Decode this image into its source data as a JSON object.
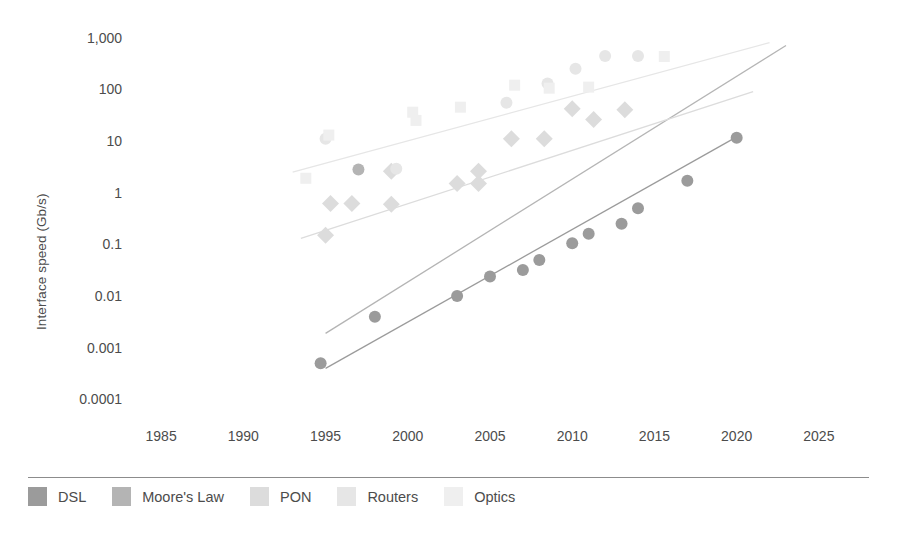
{
  "chart_data": {
    "type": "scatter",
    "title": "",
    "subtitle": "",
    "xlabel": "",
    "ylabel": "Interface speed (Gb/s)",
    "yscale": "log",
    "xlim": [
      1982.5,
      2027.5
    ],
    "ylim": [
      0.0001,
      3000
    ],
    "grid": false,
    "legend_position": "bottom",
    "x_ticks": [
      "1985",
      "1990",
      "1995",
      "2000",
      "2005",
      "2010",
      "2015",
      "2020",
      "2025"
    ],
    "y_ticks": [
      "1,000",
      "100",
      "10",
      "1",
      "0.1",
      "0.01",
      "0.001",
      "0.0001"
    ],
    "series": [
      {
        "name": "DSL",
        "color": "#9b9b9b",
        "marker": "circle",
        "trendline": true,
        "trend_x": [
          1995,
          2020
        ],
        "trend_y": [
          0.0004,
          12
        ],
        "points": [
          {
            "x": 1994.7,
            "y": 0.0005
          },
          {
            "x": 1998.0,
            "y": 0.004
          },
          {
            "x": 2003.0,
            "y": 0.01
          },
          {
            "x": 2005.0,
            "y": 0.024
          },
          {
            "x": 2007.0,
            "y": 0.032
          },
          {
            "x": 2008.0,
            "y": 0.05
          },
          {
            "x": 2010.0,
            "y": 0.105
          },
          {
            "x": 2011.0,
            "y": 0.16
          },
          {
            "x": 2013.0,
            "y": 0.25
          },
          {
            "x": 2014.0,
            "y": 0.5
          },
          {
            "x": 2017.0,
            "y": 1.7
          },
          {
            "x": 2020.0,
            "y": 11.5
          }
        ]
      },
      {
        "name": "Moore's Law",
        "color": "#b4b4b4",
        "marker": "circle",
        "trendline": true,
        "trend_x": [
          1995,
          2023
        ],
        "trend_y": [
          0.0019,
          700
        ],
        "points": [
          {
            "x": 1997.0,
            "y": 2.8
          }
        ]
      },
      {
        "name": "PON",
        "color": "#dcdcdc",
        "marker": "diamond",
        "trendline": true,
        "trend_x": [
          1993.5,
          2021
        ],
        "trend_y": [
          0.13,
          90
        ],
        "points": [
          {
            "x": 1995.0,
            "y": 0.15
          },
          {
            "x": 1995.3,
            "y": 0.62
          },
          {
            "x": 1996.6,
            "y": 0.62
          },
          {
            "x": 1999.0,
            "y": 0.6
          },
          {
            "x": 1999.0,
            "y": 2.6
          },
          {
            "x": 2003.0,
            "y": 1.5
          },
          {
            "x": 2004.3,
            "y": 1.5
          },
          {
            "x": 2004.3,
            "y": 2.6
          },
          {
            "x": 2006.3,
            "y": 11
          },
          {
            "x": 2008.3,
            "y": 11
          },
          {
            "x": 2010.0,
            "y": 42
          },
          {
            "x": 2011.3,
            "y": 26
          },
          {
            "x": 2013.2,
            "y": 40
          }
        ]
      },
      {
        "name": "Routers",
        "color": "#e6e6e6",
        "marker": "circle",
        "trendline": true,
        "trend_x": [
          1993,
          2022
        ],
        "trend_y": [
          2.5,
          800
        ],
        "points": [
          {
            "x": 1995.0,
            "y": 11
          },
          {
            "x": 1999.3,
            "y": 2.9
          },
          {
            "x": 2006.0,
            "y": 55
          },
          {
            "x": 2008.5,
            "y": 130
          },
          {
            "x": 2010.2,
            "y": 250
          },
          {
            "x": 2012.0,
            "y": 440
          },
          {
            "x": 2014.0,
            "y": 440
          }
        ]
      },
      {
        "name": "Optics",
        "color": "#efefef",
        "marker": "square",
        "trendline": false,
        "points": [
          {
            "x": 1993.8,
            "y": 1.9
          },
          {
            "x": 1995.2,
            "y": 13
          },
          {
            "x": 2000.3,
            "y": 36
          },
          {
            "x": 2000.5,
            "y": 25
          },
          {
            "x": 2003.2,
            "y": 45
          },
          {
            "x": 2006.5,
            "y": 120
          },
          {
            "x": 2008.6,
            "y": 105
          },
          {
            "x": 2011.0,
            "y": 110
          },
          {
            "x": 2015.6,
            "y": 430
          }
        ]
      }
    ]
  },
  "axes": {
    "y_title": "Interface speed (Gb/s)",
    "y_ticks": [
      {
        "label": "1,000"
      },
      {
        "label": "100"
      },
      {
        "label": "10"
      },
      {
        "label": "1"
      },
      {
        "label": "0.1"
      },
      {
        "label": "0.01"
      },
      {
        "label": "0.001"
      },
      {
        "label": "0.0001"
      }
    ],
    "x_ticks": [
      {
        "label": "1985"
      },
      {
        "label": "1990"
      },
      {
        "label": "1995"
      },
      {
        "label": "2000"
      },
      {
        "label": "2005"
      },
      {
        "label": "2010"
      },
      {
        "label": "2015"
      },
      {
        "label": "2020"
      },
      {
        "label": "2025"
      }
    ]
  },
  "legend": {
    "items": [
      {
        "label": "DSL",
        "color": "#9b9b9b"
      },
      {
        "label": "Moore's Law",
        "color": "#b4b4b4"
      },
      {
        "label": "PON",
        "color": "#dcdcdc"
      },
      {
        "label": "Routers",
        "color": "#e6e6e6"
      },
      {
        "label": "Optics",
        "color": "#efefef"
      }
    ]
  }
}
